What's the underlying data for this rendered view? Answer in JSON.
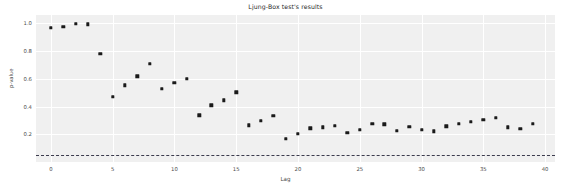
{
  "chart_data": {
    "type": "scatter",
    "title": "Ljung-Box test's results",
    "xlabel": "Lag",
    "ylabel": "p-value",
    "xlim": [
      -1.2,
      40.8
    ],
    "ylim": [
      0.0,
      1.06
    ],
    "grid": true,
    "legend": null,
    "xticks": [
      0,
      5,
      10,
      15,
      20,
      25,
      30,
      35,
      40
    ],
    "yticks": [
      0.2,
      0.4,
      0.6,
      0.8,
      1.0
    ],
    "ytick_labels": [
      "0.2",
      "0.4",
      "0.6",
      "0.8",
      "1.0"
    ],
    "xtick_labels": [
      "0",
      "5",
      "10",
      "15",
      "20",
      "25",
      "30",
      "35",
      "40"
    ],
    "marker_color": "#1a1a1a",
    "plot_background": "#f0f0f0",
    "gridline_color": "#ffffff",
    "threshold": {
      "value": 0.05,
      "style": "dashed",
      "color": "#3c3c4e",
      "label": "significance level 0.05"
    },
    "x": [
      0,
      1,
      2,
      3,
      4,
      5,
      6,
      7,
      8,
      9,
      10,
      11,
      12,
      13,
      14,
      15,
      16,
      17,
      18,
      19,
      20,
      21,
      22,
      23,
      24,
      25,
      26,
      27,
      28,
      29,
      30,
      31,
      32,
      33,
      34,
      35,
      36,
      37,
      38,
      39
    ],
    "values": [
      0.966,
      0.976,
      0.996,
      0.994,
      0.779,
      0.472,
      0.553,
      0.619,
      0.709,
      0.528,
      0.572,
      0.599,
      0.336,
      0.409,
      0.444,
      0.503,
      0.266,
      0.298,
      0.331,
      0.169,
      0.205,
      0.243,
      0.251,
      0.263,
      0.211,
      0.234,
      0.276,
      0.272,
      0.224,
      0.252,
      0.234,
      0.221,
      0.257,
      0.277,
      0.292,
      0.303,
      0.319,
      0.251,
      0.241,
      0.275
    ]
  }
}
